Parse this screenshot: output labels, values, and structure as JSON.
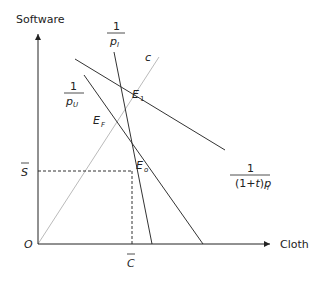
{
  "diagram": {
    "axes": {
      "y_label": "Software",
      "x_label": "Cloth",
      "origin_label": "O"
    },
    "reference_values": {
      "s_bar_label": "S",
      "c_bar_label": "C"
    },
    "lines": {
      "p_I": {
        "numerator": "1",
        "denominator_main": "p",
        "denominator_sub": "I"
      },
      "p_U": {
        "numerator": "1",
        "denominator_main": "p",
        "denominator_sub": "U"
      },
      "tariff": {
        "numerator": "1",
        "denominator_prefix": "(1+",
        "denominator_t": "t",
        "denominator_close": ")",
        "denominator_main": "p",
        "denominator_sub": "I"
      },
      "consumption_ray": {
        "label": "c"
      }
    },
    "points": {
      "E1": {
        "main": "E",
        "sub": "1"
      },
      "EF": {
        "main": "E",
        "sub": "F"
      },
      "E0": {
        "main": "E",
        "sub": "o"
      }
    }
  },
  "colors": {
    "line": "#333333",
    "ray": "#bbbbbb",
    "text": "#222222"
  }
}
